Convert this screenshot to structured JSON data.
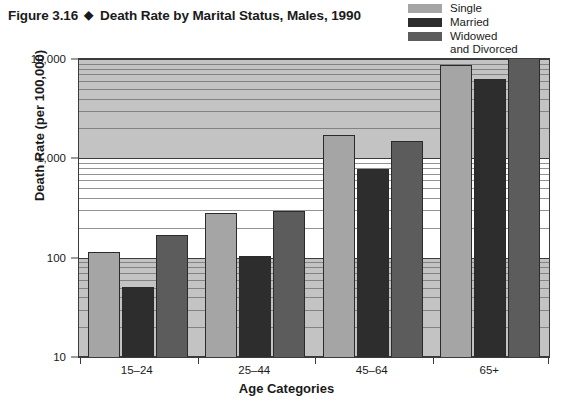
{
  "title": {
    "figure_number": "Figure 3.16",
    "bullet": "◆",
    "text": "Death Rate by Marital Status, Males, 1990"
  },
  "legend": {
    "position": "top-right",
    "items": [
      {
        "label": "Single",
        "label_line2": "",
        "color": "#a5a5a5"
      },
      {
        "label": "Married",
        "label_line2": "",
        "color": "#2d2d2d"
      },
      {
        "label": "Widowed",
        "label_line2": "and Divorced",
        "color": "#5c5c5c"
      }
    ]
  },
  "chart_data": {
    "type": "bar",
    "title": "Death Rate by Marital Status, Males, 1990",
    "xlabel": "Age Categories",
    "ylabel": "Death Rate (per 100,000)",
    "yscale": "log",
    "ylim": [
      10,
      10000
    ],
    "ytick_labels": [
      "10",
      "100",
      "1,000",
      "10,000"
    ],
    "ytick_values": [
      10,
      100,
      1000,
      10000
    ],
    "grid": true,
    "grid_minor": true,
    "categories": [
      "15–24",
      "25–44",
      "45–64",
      "65+"
    ],
    "series": [
      {
        "name": "Single",
        "color": "#a5a5a5",
        "values": [
          115,
          280,
          1700,
          8700
        ]
      },
      {
        "name": "Married",
        "color": "#2d2d2d",
        "values": [
          51,
          103,
          780,
          6300
        ]
      },
      {
        "name": "Widowed and Divorced",
        "color": "#5c5c5c",
        "values": [
          170,
          295,
          1500,
          10500
        ]
      }
    ]
  }
}
